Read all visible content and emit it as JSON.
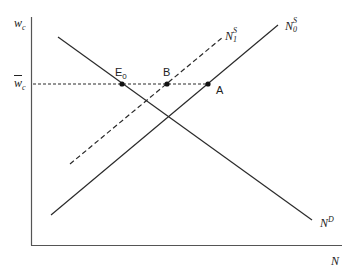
{
  "diagram": {
    "type": "labor-market supply-demand diagram",
    "colors": {
      "line": "#2a2a2a",
      "axis": "#555555",
      "background": "#ffffff"
    },
    "axes": {
      "y_label_base": "w",
      "y_label_sub": "c",
      "x_label": "N"
    },
    "wage_level": {
      "label_base": "w",
      "label_sub": "c",
      "overbar": true
    },
    "curves": {
      "demand": {
        "base": "N",
        "sup": "D",
        "style": "solid"
      },
      "supply_0": {
        "base": "N",
        "sup": "S",
        "sub": "0",
        "style": "solid"
      },
      "supply_1": {
        "base": "N",
        "sup": "S",
        "sub": "1",
        "style": "dashed"
      }
    },
    "points": {
      "e0": {
        "base": "E",
        "sub": "0"
      },
      "b": {
        "label": "B"
      },
      "a": {
        "label": "A"
      }
    }
  }
}
